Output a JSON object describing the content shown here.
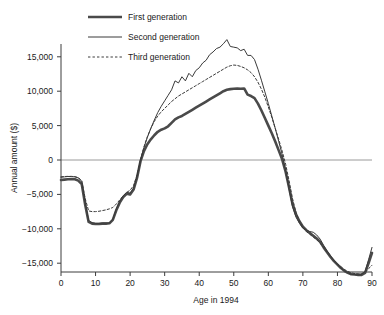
{
  "chart_data": {
    "type": "line",
    "title": "",
    "xlabel": "Age in 1994",
    "ylabel": "Annual amount ($)",
    "xlim": [
      0,
      90
    ],
    "ylim": [
      -17500,
      18500
    ],
    "xticks": [
      0,
      10,
      20,
      30,
      40,
      50,
      60,
      70,
      80,
      90
    ],
    "xtick_labels": [
      "0",
      "10",
      "20",
      "30",
      "40",
      "50",
      "60",
      "70",
      "80",
      "90"
    ],
    "yticks": [
      15000,
      10000,
      5000,
      0,
      -5000,
      -10000,
      -15000
    ],
    "ytick_labels": [
      "15,000",
      "10,000",
      "5,000",
      "0",
      "-5,000",
      "-10,000",
      "-15,000"
    ],
    "grid": false,
    "zero_reference_line": 0,
    "legend_position": "top-left",
    "x": [
      0,
      1,
      2,
      3,
      4,
      5,
      6,
      7,
      8,
      9,
      10,
      11,
      12,
      13,
      14,
      15,
      16,
      17,
      18,
      19,
      20,
      21,
      22,
      23,
      24,
      25,
      26,
      27,
      28,
      29,
      30,
      31,
      32,
      33,
      34,
      35,
      36,
      37,
      38,
      39,
      40,
      41,
      42,
      43,
      44,
      45,
      46,
      47,
      48,
      49,
      50,
      51,
      52,
      53,
      54,
      55,
      56,
      57,
      58,
      59,
      60,
      61,
      62,
      63,
      64,
      65,
      66,
      67,
      68,
      69,
      70,
      71,
      72,
      73,
      74,
      75,
      76,
      77,
      78,
      79,
      80,
      81,
      82,
      83,
      84,
      85,
      86,
      87,
      88,
      89,
      90
    ],
    "series": [
      {
        "name": "First generation",
        "style": "thick-solid",
        "color": "#4a4a4a",
        "values": [
          -2900,
          -2850,
          -2800,
          -2780,
          -2800,
          -3000,
          -3500,
          -6500,
          -9000,
          -9250,
          -9300,
          -9300,
          -9250,
          -9250,
          -9200,
          -8700,
          -7300,
          -6200,
          -5400,
          -4900,
          -5000,
          -4300,
          -2600,
          -200,
          1300,
          2300,
          3000,
          3600,
          4100,
          4400,
          4600,
          4900,
          5400,
          5900,
          6200,
          6400,
          6700,
          7000,
          7300,
          7600,
          7900,
          8200,
          8500,
          8800,
          9100,
          9400,
          9700,
          10000,
          10200,
          10300,
          10350,
          10400,
          10350,
          10400,
          9500,
          9300,
          9000,
          8200,
          7200,
          6100,
          5000,
          3900,
          2700,
          1400,
          100,
          -1700,
          -4000,
          -6400,
          -7900,
          -8900,
          -9700,
          -10200,
          -10600,
          -11000,
          -11400,
          -11900,
          -12700,
          -13400,
          -14100,
          -14700,
          -15200,
          -15700,
          -16100,
          -16400,
          -16600,
          -16650,
          -16700,
          -16700,
          -16400,
          -15000,
          -13500
        ]
      },
      {
        "name": "Second generation",
        "style": "thin-solid",
        "color": "#3a3a3a",
        "values": [
          -2500,
          -2450,
          -2400,
          -2400,
          -2450,
          -2600,
          -3100,
          -6200,
          -8800,
          -9100,
          -9200,
          -9200,
          -9150,
          -9150,
          -9150,
          -8600,
          -7100,
          -6000,
          -5200,
          -4700,
          -4800,
          -4100,
          -2400,
          0,
          1800,
          3300,
          4600,
          5800,
          6900,
          7800,
          8600,
          9400,
          10200,
          11500,
          11200,
          12100,
          11500,
          12600,
          12100,
          13000,
          13400,
          14100,
          14500,
          15300,
          15700,
          16200,
          16400,
          16900,
          17500,
          16500,
          16400,
          16300,
          15900,
          16100,
          15200,
          15200,
          14600,
          13200,
          11600,
          9900,
          8200,
          6400,
          4600,
          2700,
          800,
          -1500,
          -4200,
          -6800,
          -8300,
          -9200,
          -9900,
          -10200,
          -10400,
          -10500,
          -10900,
          -11500,
          -12400,
          -13200,
          -13900,
          -14600,
          -15200,
          -15700,
          -16100,
          -16400,
          -16600,
          -16650,
          -16700,
          -16650,
          -16200,
          -14500,
          -12700
        ]
      },
      {
        "name": "Third generation",
        "style": "dotted",
        "color": "#3a3a3a",
        "values": [
          -2450,
          -2400,
          -2380,
          -2380,
          -2420,
          -2550,
          -3000,
          -5600,
          -7400,
          -7500,
          -7500,
          -7450,
          -7350,
          -7250,
          -7100,
          -6900,
          -6400,
          -5800,
          -5200,
          -4700,
          -4400,
          -3700,
          -2200,
          0,
          1900,
          3400,
          4600,
          5600,
          6400,
          7000,
          7500,
          8000,
          8500,
          8900,
          9300,
          9600,
          9900,
          10200,
          10500,
          10800,
          11100,
          11400,
          11700,
          12000,
          12300,
          12600,
          12900,
          13200,
          13500,
          13700,
          13800,
          13750,
          13600,
          13400,
          13100,
          12700,
          12100,
          11300,
          10300,
          9100,
          7700,
          6200,
          4600,
          3000,
          1300,
          -600,
          -3000,
          -5600,
          -7600,
          -8900,
          -9800,
          -10400,
          -10800,
          -11200,
          -11600,
          -12100,
          -12700,
          -13400,
          -14000,
          -14600,
          -15100,
          -15500,
          -15900,
          -16200,
          -16400,
          -16500,
          -16550,
          -16500,
          -16300,
          -15800,
          -15300
        ]
      }
    ]
  },
  "legend": {
    "items": [
      {
        "label": "First generation",
        "style": "thick-solid"
      },
      {
        "label": "Second generation",
        "style": "thin-solid"
      },
      {
        "label": "Third generation",
        "style": "dotted"
      }
    ]
  },
  "colors": {
    "series_gen1": "#4a4a4a",
    "series_gen2": "#3a3a3a",
    "series_gen3": "#3a3a3a",
    "axis": "#3d3d3d",
    "zero_line": "#9a9a9a",
    "background": "#ffffff"
  }
}
